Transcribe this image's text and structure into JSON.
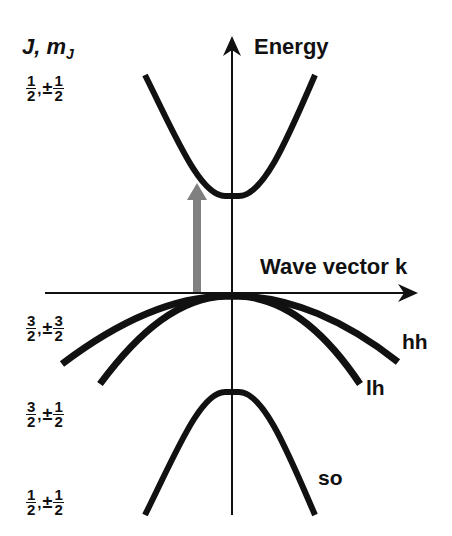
{
  "diagram": {
    "y_axis_label": "Energy",
    "x_axis_label": "Wave vector k",
    "state_header": {
      "main": "J, m",
      "sub": "J"
    },
    "states": [
      {
        "id": "cb",
        "j_num": "1",
        "j_den": "2",
        "pm": "±",
        "m_num": "1",
        "m_den": "2"
      },
      {
        "id": "hh",
        "j_num": "3",
        "j_den": "2",
        "pm": "±",
        "m_num": "3",
        "m_den": "2"
      },
      {
        "id": "lh",
        "j_num": "3",
        "j_den": "2",
        "pm": "±",
        "m_num": "1",
        "m_den": "2"
      },
      {
        "id": "so",
        "j_num": "1",
        "j_den": "2",
        "pm": "±",
        "m_num": "1",
        "m_den": "2"
      }
    ],
    "bands": [
      {
        "id": "conduction",
        "label": ""
      },
      {
        "id": "heavy-hole",
        "label": "hh"
      },
      {
        "id": "light-hole",
        "label": "lh"
      },
      {
        "id": "split-off",
        "label": "so"
      }
    ],
    "transition_arrow": {
      "color": "#808080",
      "from": "valence-band-top",
      "to": "conduction-band"
    },
    "colors": {
      "line": "#111111",
      "arrow": "#808080",
      "background": "#ffffff"
    }
  }
}
